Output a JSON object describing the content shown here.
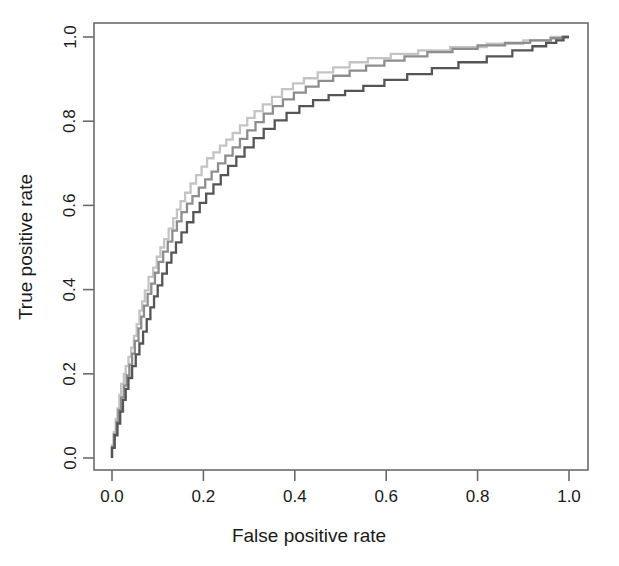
{
  "chart_data": {
    "type": "line",
    "title": "",
    "xlabel": "False positive rate",
    "ylabel": "True positive rate",
    "xlim": [
      0,
      1
    ],
    "ylim": [
      0,
      1
    ],
    "grid": false,
    "legend": "none",
    "xticks": [
      "0.0",
      "0.2",
      "0.4",
      "0.6",
      "0.8",
      "1.0"
    ],
    "xtick_values": [
      0.0,
      0.2,
      0.4,
      0.6,
      0.8,
      1.0
    ],
    "yticks": [
      "0.0",
      "0.2",
      "0.4",
      "0.6",
      "0.8",
      "1.0"
    ],
    "ytick_values": [
      0.0,
      0.2,
      0.4,
      0.6,
      0.8,
      1.0
    ],
    "series": [
      {
        "name": "roc-curve-light",
        "color": "#c4c4c4",
        "x": [
          0.0,
          0.0,
          0.004,
          0.004,
          0.008,
          0.008,
          0.012,
          0.012,
          0.016,
          0.016,
          0.02,
          0.02,
          0.026,
          0.026,
          0.03,
          0.03,
          0.036,
          0.036,
          0.042,
          0.042,
          0.048,
          0.048,
          0.054,
          0.054,
          0.06,
          0.06,
          0.066,
          0.066,
          0.072,
          0.072,
          0.08,
          0.08,
          0.09,
          0.09,
          0.098,
          0.098,
          0.106,
          0.106,
          0.114,
          0.114,
          0.124,
          0.124,
          0.134,
          0.134,
          0.142,
          0.142,
          0.15,
          0.15,
          0.16,
          0.16,
          0.172,
          0.172,
          0.184,
          0.184,
          0.196,
          0.196,
          0.208,
          0.208,
          0.222,
          0.222,
          0.236,
          0.236,
          0.25,
          0.25,
          0.264,
          0.264,
          0.28,
          0.28,
          0.296,
          0.296,
          0.312,
          0.312,
          0.33,
          0.33,
          0.35,
          0.35,
          0.372,
          0.372,
          0.396,
          0.396,
          0.42,
          0.42,
          0.45,
          0.45,
          0.484,
          0.484,
          0.52,
          0.52,
          0.56,
          0.56,
          0.61,
          0.61,
          0.67,
          0.67,
          0.74,
          0.74,
          0.82,
          0.82,
          0.9,
          0.9,
          0.96,
          0.96,
          1.0
        ],
        "y": [
          0.0,
          0.03,
          0.03,
          0.062,
          0.062,
          0.092,
          0.092,
          0.118,
          0.118,
          0.15,
          0.15,
          0.176,
          0.176,
          0.2,
          0.2,
          0.218,
          0.218,
          0.24,
          0.24,
          0.262,
          0.262,
          0.29,
          0.29,
          0.318,
          0.318,
          0.35,
          0.35,
          0.372,
          0.372,
          0.398,
          0.398,
          0.43,
          0.43,
          0.452,
          0.452,
          0.478,
          0.478,
          0.5,
          0.5,
          0.52,
          0.52,
          0.545,
          0.545,
          0.57,
          0.57,
          0.59,
          0.59,
          0.61,
          0.61,
          0.63,
          0.63,
          0.652,
          0.652,
          0.672,
          0.672,
          0.692,
          0.692,
          0.712,
          0.712,
          0.726,
          0.726,
          0.742,
          0.742,
          0.756,
          0.756,
          0.772,
          0.772,
          0.79,
          0.79,
          0.808,
          0.808,
          0.824,
          0.824,
          0.84,
          0.84,
          0.858,
          0.858,
          0.876,
          0.876,
          0.89,
          0.89,
          0.902,
          0.902,
          0.916,
          0.916,
          0.928,
          0.928,
          0.94,
          0.94,
          0.95,
          0.95,
          0.96,
          0.96,
          0.968,
          0.968,
          0.976,
          0.976,
          0.984,
          0.984,
          0.992,
          0.992,
          1.0,
          1.0
        ]
      },
      {
        "name": "roc-curve-medium",
        "color": "#8d8d8d",
        "x": [
          0.0,
          0.0,
          0.004,
          0.004,
          0.01,
          0.01,
          0.014,
          0.014,
          0.02,
          0.02,
          0.026,
          0.026,
          0.032,
          0.032,
          0.038,
          0.038,
          0.044,
          0.044,
          0.05,
          0.05,
          0.058,
          0.058,
          0.064,
          0.064,
          0.07,
          0.07,
          0.078,
          0.078,
          0.086,
          0.086,
          0.094,
          0.094,
          0.102,
          0.102,
          0.112,
          0.112,
          0.122,
          0.122,
          0.132,
          0.132,
          0.142,
          0.142,
          0.152,
          0.152,
          0.164,
          0.164,
          0.176,
          0.176,
          0.19,
          0.19,
          0.204,
          0.204,
          0.218,
          0.218,
          0.232,
          0.232,
          0.248,
          0.248,
          0.264,
          0.264,
          0.28,
          0.28,
          0.296,
          0.296,
          0.314,
          0.314,
          0.332,
          0.332,
          0.352,
          0.352,
          0.374,
          0.374,
          0.398,
          0.398,
          0.424,
          0.424,
          0.452,
          0.452,
          0.484,
          0.484,
          0.52,
          0.52,
          0.556,
          0.556,
          0.596,
          0.596,
          0.64,
          0.64,
          0.69,
          0.69,
          0.745,
          0.745,
          0.8,
          0.8,
          0.86,
          0.86,
          0.915,
          0.915,
          0.96,
          0.96,
          0.985,
          0.985,
          1.0
        ],
        "y": [
          0.0,
          0.026,
          0.026,
          0.056,
          0.056,
          0.086,
          0.086,
          0.114,
          0.114,
          0.144,
          0.144,
          0.172,
          0.172,
          0.196,
          0.196,
          0.222,
          0.222,
          0.248,
          0.248,
          0.278,
          0.278,
          0.308,
          0.308,
          0.336,
          0.336,
          0.362,
          0.362,
          0.39,
          0.39,
          0.414,
          0.414,
          0.44,
          0.44,
          0.466,
          0.466,
          0.49,
          0.49,
          0.514,
          0.514,
          0.54,
          0.54,
          0.562,
          0.562,
          0.584,
          0.584,
          0.604,
          0.604,
          0.622,
          0.622,
          0.642,
          0.642,
          0.662,
          0.662,
          0.68,
          0.68,
          0.7,
          0.7,
          0.718,
          0.718,
          0.738,
          0.738,
          0.758,
          0.758,
          0.778,
          0.778,
          0.798,
          0.798,
          0.818,
          0.818,
          0.836,
          0.836,
          0.852,
          0.852,
          0.868,
          0.868,
          0.882,
          0.882,
          0.896,
          0.896,
          0.908,
          0.908,
          0.92,
          0.92,
          0.932,
          0.932,
          0.944,
          0.944,
          0.954,
          0.954,
          0.964,
          0.964,
          0.972,
          0.972,
          0.98,
          0.98,
          0.986,
          0.986,
          0.992,
          0.992,
          0.997,
          0.997,
          1.0,
          1.0
        ]
      },
      {
        "name": "roc-curve-dark",
        "color": "#555555",
        "x": [
          0.0,
          0.0,
          0.006,
          0.006,
          0.012,
          0.012,
          0.018,
          0.018,
          0.024,
          0.024,
          0.03,
          0.03,
          0.036,
          0.036,
          0.044,
          0.044,
          0.052,
          0.052,
          0.06,
          0.06,
          0.068,
          0.068,
          0.076,
          0.076,
          0.084,
          0.084,
          0.092,
          0.092,
          0.1,
          0.1,
          0.11,
          0.11,
          0.12,
          0.12,
          0.13,
          0.13,
          0.14,
          0.14,
          0.152,
          0.152,
          0.164,
          0.164,
          0.178,
          0.178,
          0.192,
          0.192,
          0.206,
          0.206,
          0.222,
          0.222,
          0.238,
          0.238,
          0.254,
          0.254,
          0.272,
          0.272,
          0.29,
          0.29,
          0.31,
          0.31,
          0.332,
          0.332,
          0.356,
          0.356,
          0.382,
          0.382,
          0.41,
          0.41,
          0.44,
          0.44,
          0.474,
          0.474,
          0.51,
          0.51,
          0.55,
          0.55,
          0.596,
          0.596,
          0.646,
          0.646,
          0.7,
          0.7,
          0.758,
          0.758,
          0.82,
          0.82,
          0.876,
          0.876,
          0.92,
          0.92,
          0.95,
          0.95,
          0.972,
          0.972,
          0.988,
          0.988,
          1.0
        ],
        "y": [
          0.0,
          0.024,
          0.024,
          0.054,
          0.054,
          0.082,
          0.082,
          0.11,
          0.11,
          0.138,
          0.138,
          0.164,
          0.164,
          0.19,
          0.19,
          0.218,
          0.218,
          0.246,
          0.246,
          0.272,
          0.272,
          0.3,
          0.3,
          0.33,
          0.33,
          0.358,
          0.358,
          0.384,
          0.384,
          0.41,
          0.41,
          0.438,
          0.438,
          0.464,
          0.464,
          0.488,
          0.488,
          0.512,
          0.512,
          0.536,
          0.536,
          0.56,
          0.56,
          0.584,
          0.584,
          0.606,
          0.606,
          0.628,
          0.628,
          0.65,
          0.65,
          0.672,
          0.672,
          0.694,
          0.694,
          0.716,
          0.716,
          0.738,
          0.738,
          0.76,
          0.76,
          0.782,
          0.782,
          0.802,
          0.802,
          0.82,
          0.82,
          0.836,
          0.836,
          0.85,
          0.85,
          0.862,
          0.862,
          0.872,
          0.872,
          0.884,
          0.884,
          0.898,
          0.898,
          0.912,
          0.912,
          0.926,
          0.926,
          0.94,
          0.94,
          0.954,
          0.954,
          0.968,
          0.968,
          0.978,
          0.978,
          0.986,
          0.986,
          0.992,
          0.992,
          1.0,
          1.0
        ]
      }
    ]
  },
  "plot": {
    "frame_color": "#6b6b6b",
    "background": "#ffffff"
  }
}
